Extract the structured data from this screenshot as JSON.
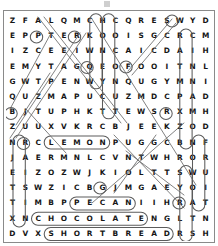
{
  "puzzle": {
    "type": "word-search",
    "rows": 15,
    "cols": 16,
    "grid": [
      [
        "Z",
        "F",
        "A",
        "L",
        "Q",
        "M",
        "C",
        "H",
        "C",
        "Q",
        "R",
        "E",
        "S",
        "W",
        "Y",
        "D"
      ],
      [
        "E",
        "P",
        "P",
        "T",
        "E",
        "R",
        "K",
        "O",
        "O",
        "I",
        "S",
        "G",
        "C",
        "R",
        "C",
        "M"
      ],
      [
        "I",
        "Z",
        "C",
        "E",
        "E",
        "I",
        "W",
        "N",
        "C",
        "A",
        "I",
        "C",
        "D",
        "A",
        "I",
        "H"
      ],
      [
        "E",
        "M",
        "Y",
        "T",
        "A",
        "G",
        "Q",
        "E",
        "O",
        "F",
        "O",
        "O",
        "I",
        "T",
        "N",
        "L"
      ],
      [
        "G",
        "W",
        "T",
        "P",
        "E",
        "N",
        "W",
        "Y",
        "N",
        "Q",
        "U",
        "G",
        "Y",
        "M",
        "N",
        "I"
      ],
      [
        "Q",
        "U",
        "Z",
        "M",
        "A",
        "P",
        "U",
        "C",
        "U",
        "Z",
        "M",
        "D",
        "C",
        "P",
        "A",
        "D"
      ],
      [
        "B",
        "J",
        "T",
        "U",
        "P",
        "H",
        "K",
        "T",
        "T",
        "E",
        "W",
        "S",
        "R",
        "X",
        "M",
        "H"
      ],
      [
        "Z",
        "U",
        "U",
        "X",
        "V",
        "K",
        "R",
        "C",
        "B",
        "J",
        "E",
        "E",
        "K",
        "Z",
        "O",
        "D"
      ],
      [
        "N",
        "R",
        "C",
        "L",
        "E",
        "M",
        "O",
        "N",
        "P",
        "U",
        "G",
        "G",
        "C",
        "B",
        "N",
        "F"
      ],
      [
        "J",
        "A",
        "E",
        "R",
        "M",
        "N",
        "L",
        "C",
        "V",
        "N",
        "T",
        "W",
        "H",
        "R",
        "O",
        "R"
      ],
      [
        "E",
        "I",
        "Z",
        "O",
        "Z",
        "W",
        "J",
        "K",
        "I",
        "O",
        "L",
        "T",
        "T",
        "S",
        "W",
        "U"
      ],
      [
        "T",
        "S",
        "W",
        "Z",
        "I",
        "C",
        "B",
        "G",
        "J",
        "M",
        "G",
        "A",
        "E",
        "Y",
        "O",
        "I"
      ],
      [
        "T",
        "I",
        "M",
        "B",
        "P",
        "P",
        "E",
        "C",
        "A",
        "N",
        "I",
        "I",
        "H",
        "R",
        "A",
        "T"
      ],
      [
        "X",
        "N",
        "C",
        "H",
        "O",
        "C",
        "O",
        "L",
        "A",
        "T",
        "E",
        "N",
        "G",
        "L",
        "T",
        "N"
      ],
      [
        "D",
        "V",
        "X",
        "S",
        "H",
        "O",
        "R",
        "T",
        "B",
        "R",
        "E",
        "A",
        "D",
        "R",
        "S",
        "H"
      ]
    ],
    "found_words": [
      {
        "word": "LEMON",
        "orientation": "horizontal",
        "row": 8,
        "col_start": 3,
        "col_end": 7
      },
      {
        "word": "PECAN",
        "orientation": "horizontal",
        "row": 12,
        "col_start": 5,
        "col_end": 9
      },
      {
        "word": "CHOCOLATE",
        "orientation": "horizontal",
        "row": 13,
        "col_start": 2,
        "col_end": 10
      },
      {
        "word": "SHORTBREAD",
        "orientation": "horizontal",
        "row": 14,
        "col_start": 3,
        "col_end": 12
      },
      {
        "word": "COCONUT",
        "orientation": "vertical",
        "col": 8,
        "row_start": 0,
        "row_end": 6
      },
      {
        "word": "HONEY",
        "orientation": "vertical",
        "col": 7,
        "row_start": 0,
        "row_end": 4
      },
      {
        "word": "CINNAMON",
        "orientation": "vertical",
        "col": 14,
        "row_start": 1,
        "row_end": 8
      },
      {
        "word": "RAISIN",
        "orientation": "vertical",
        "col": 1,
        "row_start": 8,
        "row_end": 13
      },
      {
        "word": "FRUIT",
        "orientation": "vertical",
        "col": 15,
        "row_start": 8,
        "row_end": 12
      },
      {
        "word": "WOULD",
        "orientation": "vertical",
        "col": 14,
        "row_start": 10,
        "row_end": 14
      },
      {
        "word": "DIAGONAL-1",
        "orientation": "diagonal-down-right",
        "row_start": 0,
        "col_start": 2,
        "row_end": 7,
        "col_end": 9
      },
      {
        "word": "DIAGONAL-2",
        "orientation": "diagonal-down-left",
        "row_start": 1,
        "col_start": 5,
        "row_end": 8,
        "col_end": 0
      },
      {
        "word": "DIAGONAL-3",
        "orientation": "diagonal-up-right",
        "row_start": 3,
        "col_start": 9,
        "row_end": 0,
        "col_end": 12
      },
      {
        "word": "DIAGONAL-4",
        "orientation": "diagonal-down-right",
        "row_start": 0,
        "col_start": 6,
        "row_end": 11,
        "col_end": 14
      },
      {
        "word": "DIAGONAL-5",
        "orientation": "diagonal-down-left",
        "row_start": 7,
        "col_start": 13,
        "row_end": 12,
        "col_end": 6
      },
      {
        "word": "DIAGONAL-6",
        "orientation": "diagonal-down-right",
        "row_start": 8,
        "col_start": 8,
        "row_end": 12,
        "col_end": 13
      }
    ]
  },
  "colors": {
    "frame_border": "#8a8a8a",
    "letter": "#161616",
    "highlight_stroke": "#5c5c5c",
    "background": "#ffffff"
  }
}
